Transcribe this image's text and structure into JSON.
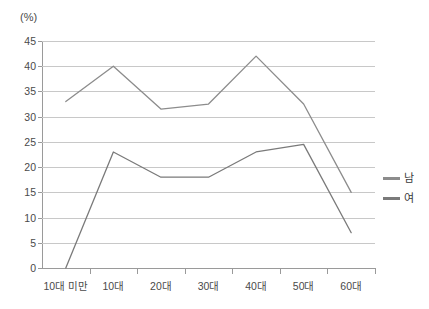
{
  "chart_data": {
    "type": "line",
    "title": "",
    "xlabel": "",
    "ylabel": "(%)",
    "unit_label": "(%)",
    "categories": [
      "10대 미만",
      "10대",
      "20대",
      "30대",
      "40대",
      "50대",
      "60대"
    ],
    "series": [
      {
        "name": "남",
        "color": "#8c8c8c",
        "values": [
          33,
          40,
          31.5,
          32.5,
          42,
          32.5,
          15
        ]
      },
      {
        "name": "여",
        "color": "#7a7a7a",
        "values": [
          0,
          23,
          18,
          18,
          23,
          24.5,
          7
        ]
      }
    ],
    "ylim": [
      0,
      45
    ],
    "ytick_step": 5,
    "yticks": [
      "0",
      "5",
      "10",
      "15",
      "20",
      "25",
      "30",
      "35",
      "40",
      "45"
    ],
    "grid": true,
    "grid_axis": "y",
    "legend_position": "right",
    "legend": [
      "남",
      "여"
    ]
  },
  "colors": {
    "axis": "#9a9a9a",
    "grid": "#c8c8c8",
    "text": "#3a3a3a",
    "background": "#ffffff"
  }
}
